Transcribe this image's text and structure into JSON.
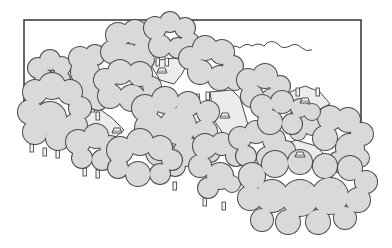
{
  "illustration": {
    "title": "Forest map illustration",
    "caption": "",
    "colors": {
      "background": "#ffffff",
      "frame": "#333333",
      "tree_fill": "#d9d9d9",
      "tree_stroke": "#4a4a4a",
      "clearing_fill": "#ececec",
      "trunk_fill": "#f4f4f4"
    },
    "frame": {
      "x1": 24,
      "y1": 20,
      "x2": 361,
      "left_bottom": 122,
      "right_bottom": 122
    },
    "trees": [
      {
        "name": "tree-top-left-small",
        "blobs": [
          [
            38,
            68,
            10
          ],
          [
            50,
            60,
            10
          ],
          [
            62,
            66,
            9
          ],
          [
            45,
            80,
            10
          ],
          [
            60,
            80,
            10
          ]
        ]
      },
      {
        "name": "tree-left-tall",
        "blobs": [
          [
            80,
            58,
            11
          ],
          [
            95,
            55,
            10
          ],
          [
            85,
            72,
            14
          ],
          [
            92,
            90,
            14
          ],
          [
            80,
            100,
            11
          ],
          [
            98,
            100,
            10
          ]
        ]
      },
      {
        "name": "tree-upper-mid",
        "blobs": [
          [
            118,
            35,
            12
          ],
          [
            135,
            32,
            12
          ],
          [
            145,
            45,
            10
          ],
          [
            112,
            52,
            11
          ],
          [
            128,
            58,
            14
          ],
          [
            145,
            60,
            9
          ]
        ]
      },
      {
        "name": "tree-top-center",
        "blobs": [
          [
            155,
            28,
            11
          ],
          [
            170,
            22,
            10
          ],
          [
            185,
            28,
            10
          ],
          [
            190,
            42,
            9
          ],
          [
            160,
            46,
            11
          ],
          [
            178,
            48,
            10
          ]
        ]
      },
      {
        "name": "tree-top-right-of-center",
        "blobs": [
          [
            190,
            58,
            11
          ],
          [
            205,
            48,
            12
          ],
          [
            222,
            52,
            12
          ],
          [
            233,
            66,
            10
          ],
          [
            200,
            72,
            12
          ],
          [
            220,
            78,
            12
          ],
          [
            235,
            82,
            8
          ]
        ]
      },
      {
        "name": "tree-mid-left",
        "blobs": [
          [
            105,
            80,
            11
          ],
          [
            120,
            72,
            12
          ],
          [
            140,
            74,
            12
          ],
          [
            152,
            86,
            9
          ],
          [
            110,
            96,
            12
          ],
          [
            132,
            98,
            13
          ],
          [
            150,
            96,
            8
          ]
        ]
      },
      {
        "name": "tree-big-left",
        "blobs": [
          [
            35,
            92,
            12
          ],
          [
            52,
            86,
            13
          ],
          [
            70,
            92,
            12
          ],
          [
            80,
            108,
            11
          ],
          [
            30,
            112,
            12
          ],
          [
            50,
            118,
            16
          ],
          [
            75,
            126,
            12
          ],
          [
            35,
            132,
            12
          ],
          [
            58,
            138,
            12
          ],
          [
            78,
            140,
            10
          ]
        ]
      },
      {
        "name": "tree-right-mid",
        "blobs": [
          [
            248,
            80,
            11
          ],
          [
            265,
            76,
            12
          ],
          [
            280,
            86,
            10
          ],
          [
            252,
            96,
            11
          ],
          [
            272,
            100,
            11
          ]
        ]
      },
      {
        "name": "tree-big-center",
        "blobs": [
          [
            145,
            108,
            13
          ],
          [
            165,
            100,
            13
          ],
          [
            188,
            104,
            12
          ],
          [
            208,
            112,
            11
          ],
          [
            150,
            128,
            15
          ],
          [
            178,
            126,
            18
          ],
          [
            205,
            132,
            12
          ],
          [
            160,
            152,
            14
          ],
          [
            188,
            152,
            14
          ],
          [
            210,
            152,
            10
          ],
          [
            175,
            166,
            10
          ]
        ]
      },
      {
        "name": "tree-right-small",
        "blobs": [
          [
            300,
            118,
            10
          ],
          [
            312,
            126,
            9
          ],
          [
            298,
            132,
            8
          ]
        ]
      },
      {
        "name": "tree-far-right",
        "blobs": [
          [
            330,
            118,
            12
          ],
          [
            348,
            120,
            12
          ],
          [
            362,
            134,
            11
          ],
          [
            325,
            138,
            12
          ],
          [
            350,
            148,
            14
          ],
          [
            338,
            162,
            10
          ],
          [
            360,
            158,
            9
          ]
        ]
      },
      {
        "name": "tree-lower-left",
        "blobs": [
          [
            78,
            142,
            12
          ],
          [
            96,
            136,
            12
          ],
          [
            110,
            146,
            10
          ],
          [
            82,
            158,
            10
          ],
          [
            102,
            160,
            10
          ]
        ]
      },
      {
        "name": "tree-lower-mid",
        "blobs": [
          [
            120,
            150,
            13
          ],
          [
            140,
            142,
            13
          ],
          [
            160,
            148,
            12
          ],
          [
            172,
            160,
            10
          ],
          [
            118,
            168,
            10
          ],
          [
            138,
            174,
            12
          ],
          [
            160,
            174,
            10
          ]
        ]
      },
      {
        "name": "tree-lower-center-right",
        "blobs": [
          [
            205,
            146,
            12
          ],
          [
            222,
            144,
            11
          ],
          [
            236,
            156,
            10
          ],
          [
            200,
            166,
            11
          ],
          [
            220,
            176,
            13
          ],
          [
            208,
            188,
            10
          ],
          [
            232,
            184,
            8
          ]
        ]
      },
      {
        "name": "tree-mid-right-cluster",
        "blobs": [
          [
            240,
            138,
            11
          ],
          [
            256,
            132,
            11
          ],
          [
            274,
            140,
            11
          ],
          [
            286,
            150,
            9
          ],
          [
            246,
            156,
            10
          ],
          [
            268,
            158,
            11
          ]
        ]
      },
      {
        "name": "tree-upper-right-cluster",
        "blobs": [
          [
            262,
            106,
            11
          ],
          [
            282,
            102,
            11
          ],
          [
            300,
            108,
            9
          ],
          [
            270,
            122,
            12
          ],
          [
            292,
            124,
            10
          ],
          [
            312,
            112,
            8
          ]
        ]
      },
      {
        "name": "tree-big-bottom-right",
        "blobs": [
          [
            252,
            176,
            13
          ],
          [
            275,
            164,
            13
          ],
          [
            300,
            162,
            12
          ],
          [
            325,
            166,
            12
          ],
          [
            350,
            168,
            12
          ],
          [
            366,
            182,
            11
          ],
          [
            250,
            198,
            12
          ],
          [
            272,
            196,
            16
          ],
          [
            300,
            198,
            18
          ],
          [
            330,
            196,
            18
          ],
          [
            358,
            200,
            12
          ],
          [
            262,
            220,
            11
          ],
          [
            288,
            222,
            12
          ],
          [
            318,
            222,
            12
          ],
          [
            345,
            218,
            11
          ]
        ]
      }
    ],
    "clearings": [
      {
        "name": "clearing-top-center",
        "points": "150,64 158,60 175,58 188,62 182,74 174,84 160,80"
      },
      {
        "name": "clearing-center",
        "points": "210,92 232,90 240,98 246,118 250,132 238,142 226,138 214,120"
      },
      {
        "name": "clearing-upper-right",
        "points": "290,92 305,86 320,92 330,104 318,110 302,112 292,106"
      },
      {
        "name": "clearing-left-mid",
        "points": "82,112 98,108 112,118 124,130 112,140 96,134 86,124"
      },
      {
        "name": "clearing-right-lower",
        "points": "280,146 296,140 316,146 328,158 312,164 292,160"
      }
    ],
    "huts": [
      {
        "name": "hut-top-center",
        "x": 162,
        "y": 70
      },
      {
        "name": "hut-center",
        "x": 225,
        "y": 115
      },
      {
        "name": "hut-upper-right",
        "x": 305,
        "y": 100
      },
      {
        "name": "hut-left-mid",
        "x": 117,
        "y": 130
      },
      {
        "name": "hut-right-lower",
        "x": 300,
        "y": 154
      }
    ],
    "trunks": [
      {
        "x": 156,
        "y": 58
      },
      {
        "x": 165,
        "y": 58
      },
      {
        "x": 196,
        "y": 94
      },
      {
        "x": 206,
        "y": 92
      },
      {
        "x": 84,
        "y": 102
      },
      {
        "x": 91,
        "y": 104
      },
      {
        "x": 96,
        "y": 112
      },
      {
        "x": 30,
        "y": 144
      },
      {
        "x": 43,
        "y": 148
      },
      {
        "x": 56,
        "y": 150
      },
      {
        "x": 83,
        "y": 168
      },
      {
        "x": 96,
        "y": 170
      },
      {
        "x": 173,
        "y": 182
      },
      {
        "x": 203,
        "y": 198
      },
      {
        "x": 222,
        "y": 202
      },
      {
        "x": 296,
        "y": 88
      },
      {
        "x": 316,
        "y": 88
      },
      {
        "x": 246,
        "y": 92
      },
      {
        "x": 256,
        "y": 94
      }
    ],
    "cloud_outline": "M228,48 q6,-4 12,0 q6,-6 12,-2 q6,-4 12,0 q6,-8 14,-2 q4,6 12,2 q6,-4 12,2 q4,4 10,2"
  }
}
